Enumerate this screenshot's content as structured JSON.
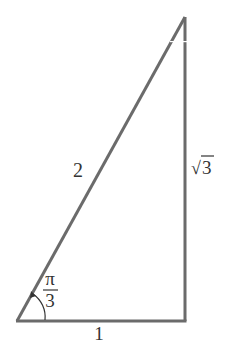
{
  "diagram": {
    "type": "right-triangle",
    "colors": {
      "stroke": "#6b6b6b",
      "text": "#333333",
      "background": "#ffffff"
    },
    "vertices": {
      "bottom_left": [
        17,
        321
      ],
      "bottom_right": [
        186,
        321
      ],
      "top": [
        185,
        17
      ]
    },
    "sides": {
      "hypotenuse": {
        "label": "2"
      },
      "base": {
        "label": "1"
      },
      "vertical": {
        "label_radical": "√",
        "label_value": "3"
      }
    },
    "angle": {
      "numerator": "π",
      "denominator": "3"
    }
  }
}
